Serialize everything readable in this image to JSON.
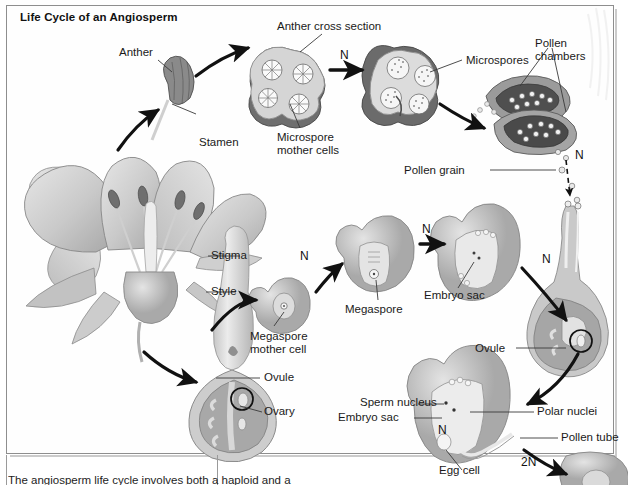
{
  "figure": {
    "title": "Life Cycle of an Angiosperm",
    "type": "biology-diagram",
    "caption_partial": "The angiosperm life cycle involves both a haploid and a diploid"
  },
  "labels": {
    "anther": "Anther",
    "stamen": "Stamen",
    "anther_cross_section": "Anther cross section",
    "microspore_mother_cells": "Microspore\nmother cells",
    "microspores": "Microspores",
    "pollen_chambers": "Pollen\nchambers",
    "pollen_grain": "Pollen grain",
    "stigma": "Stigma",
    "style": "Style",
    "ovule_left": "Ovule",
    "ovary": "Ovary",
    "megaspore_mother_cell": "Megaspore\nmother cell",
    "megaspore": "Megaspore",
    "embryo_sac_top": "Embryo sac",
    "ovule_right": "Ovule",
    "sperm_nucleus": "Sperm nucleus",
    "embryo_sac_bottom": "Embryo sac",
    "polar_nuclei": "Polar nuclei",
    "pollen_tube": "Pollen tube",
    "egg_cell": "Egg cell"
  },
  "ploidy_marks": {
    "n1": "N",
    "n2": "N",
    "n3": "N",
    "n4": "N",
    "n5": "N",
    "n6": "N",
    "n7": "N",
    "two_n": "2N"
  },
  "colors": {
    "ink": "#1a1a1a",
    "frame": "#8e8e8e",
    "tissue_light": "#d9d9d9",
    "tissue_mid": "#b3b3b3",
    "tissue_dark": "#7d7d7d",
    "tissue_darker": "#5e5e5e",
    "cell_white": "#f7f7f7",
    "arrow": "#111111",
    "page": "#ffffff"
  }
}
